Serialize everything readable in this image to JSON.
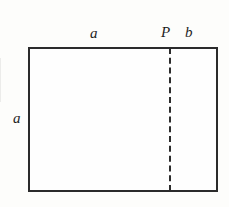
{
  "figure": {
    "background_color": "#fdfdfb",
    "line_color": "#2b2b2b",
    "text_color": "#1d1d1d",
    "labels": {
      "top_left_segment": "a",
      "point": "P",
      "top_right_segment": "b",
      "left_side": "a"
    }
  },
  "chart_data": {
    "type": "diagram",
    "title": "",
    "shapes": [
      {
        "name": "outer-rectangle",
        "kind": "rectangle",
        "x": 28,
        "y": 47,
        "width": 190,
        "height": 145,
        "stroke": "#2b2b2b",
        "stroke_width": 2,
        "fill": "none"
      },
      {
        "name": "divider-segment",
        "kind": "line",
        "x1": 169,
        "y1": 47,
        "x2": 169,
        "y2": 192,
        "stroke": "#2b2b2b",
        "stroke_width": 2,
        "dash": "9 5"
      }
    ],
    "annotations": [
      {
        "text": "a",
        "x": 95,
        "y": 33,
        "style": "italic",
        "describes": "top edge left segment length"
      },
      {
        "text": "P",
        "x": 166,
        "y": 33,
        "style": "italic",
        "describes": "division point on top edge"
      },
      {
        "text": "b",
        "x": 189,
        "y": 33,
        "style": "italic",
        "describes": "top edge right segment length"
      },
      {
        "text": "a",
        "x": 18,
        "y": 118,
        "style": "italic",
        "describes": "left edge height"
      }
    ]
  }
}
